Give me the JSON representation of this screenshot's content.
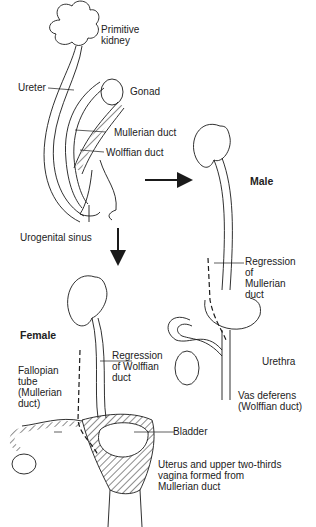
{
  "diagram": {
    "stages": {
      "indifferent": {
        "labels": {
          "primitive_kidney": "Primitive\nkidney",
          "ureter": "Ureter",
          "gonad": "Gonad",
          "mullerian_duct": "Mullerian duct",
          "wolffian_duct": "Wolffian duct",
          "urogenital_sinus": "Urogenital sinus"
        }
      },
      "male": {
        "title": "Male",
        "labels": {
          "regression_mullerian": "Regression\nof\nMullerian\nduct",
          "urethra": "Urethra",
          "vas_deferens": "Vas deferens\n(Wolffian duct)"
        }
      },
      "female": {
        "title": "Female",
        "labels": {
          "regression_wolffian": "Regression\nof Wolffian\nduct",
          "fallopian_tube": "Fallopian\ntube\n(Mullerian\nduct)",
          "bladder": "Bladder",
          "uterus_vagina": "Uterus and upper two-thirds\nvagina formed from\nMullerian duct"
        }
      }
    },
    "arrows": [
      {
        "name": "to-male",
        "direction": "right"
      },
      {
        "name": "to-female",
        "direction": "down"
      }
    ],
    "colors": {
      "line": "#1a1a1a",
      "background": "#ffffff"
    }
  }
}
